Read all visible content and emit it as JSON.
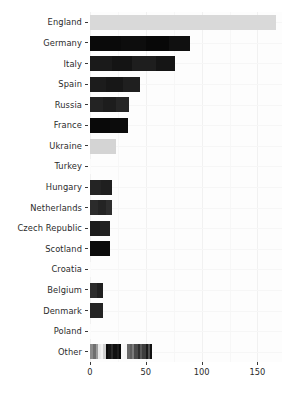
{
  "chart_data": {
    "type": "bar",
    "orientation": "horizontal",
    "title": "",
    "subtitle": "",
    "xlabel": "",
    "ylabel": "",
    "xlim": [
      0,
      172
    ],
    "xticks": [
      0,
      50,
      100,
      150
    ],
    "xticklabels": [
      "0",
      "50",
      "100",
      "150"
    ],
    "grid": true,
    "legend": "none",
    "categories": [
      "England",
      "Germany",
      "Italy",
      "Spain",
      "Russia",
      "France",
      "Ukraine",
      "Turkey",
      "Hungary",
      "Netherlands",
      "Czech Republic",
      "Scotland",
      "Croatia",
      "Belgium",
      "Denmark",
      "Poland",
      "Other"
    ],
    "values": [
      167,
      90,
      76,
      45,
      35,
      34,
      23,
      1,
      20,
      20,
      18,
      18,
      1,
      12,
      12,
      1,
      56
    ],
    "bars": [
      {
        "category": "England",
        "total": 167,
        "segments": [
          {
            "value": 167,
            "color": "#d9d9d9"
          }
        ]
      },
      {
        "category": "Germany",
        "total": 90,
        "segments": [
          {
            "value": 28,
            "color": "#0a0a0a"
          },
          {
            "value": 22,
            "color": "#0d0d0d"
          },
          {
            "value": 21,
            "color": "#080808"
          },
          {
            "value": 19,
            "color": "#101010"
          }
        ]
      },
      {
        "category": "Italy",
        "total": 76,
        "segments": [
          {
            "value": 20,
            "color": "#1a1a1a"
          },
          {
            "value": 18,
            "color": "#141414"
          },
          {
            "value": 21,
            "color": "#1e1e1e"
          },
          {
            "value": 17,
            "color": "#151515"
          }
        ]
      },
      {
        "category": "Spain",
        "total": 45,
        "segments": [
          {
            "value": 14,
            "color": "#1c1c1c"
          },
          {
            "value": 16,
            "color": "#171717"
          },
          {
            "value": 15,
            "color": "#1f1f1f"
          }
        ]
      },
      {
        "category": "Russia",
        "total": 35,
        "segments": [
          {
            "value": 12,
            "color": "#232323"
          },
          {
            "value": 11,
            "color": "#1d1d1d"
          },
          {
            "value": 12,
            "color": "#262626"
          }
        ]
      },
      {
        "category": "France",
        "total": 34,
        "segments": [
          {
            "value": 18,
            "color": "#090909"
          },
          {
            "value": 16,
            "color": "#0c0c0c"
          }
        ]
      },
      {
        "category": "Ukraine",
        "total": 23,
        "segments": [
          {
            "value": 23,
            "color": "#d4d4d4"
          }
        ]
      },
      {
        "category": "Turkey",
        "total": 1,
        "segments": [
          {
            "value": 1,
            "color": "#fbfbfb"
          }
        ]
      },
      {
        "category": "Hungary",
        "total": 20,
        "segments": [
          {
            "value": 10,
            "color": "#242424"
          },
          {
            "value": 10,
            "color": "#1f1f1f"
          }
        ]
      },
      {
        "category": "Netherlands",
        "total": 20,
        "segments": [
          {
            "value": 7,
            "color": "#2b2b2b"
          },
          {
            "value": 7,
            "color": "#242424"
          },
          {
            "value": 6,
            "color": "#2e2e2e"
          }
        ]
      },
      {
        "category": "Czech Republic",
        "total": 18,
        "segments": [
          {
            "value": 9,
            "color": "#1b1b1b"
          },
          {
            "value": 9,
            "color": "#212121"
          }
        ]
      },
      {
        "category": "Scotland",
        "total": 18,
        "segments": [
          {
            "value": 18,
            "color": "#0b0b0b"
          }
        ]
      },
      {
        "category": "Croatia",
        "total": 1,
        "segments": [
          {
            "value": 1,
            "color": "#fbfbfb"
          }
        ]
      },
      {
        "category": "Belgium",
        "total": 12,
        "segments": [
          {
            "value": 6,
            "color": "#2c2c2c"
          },
          {
            "value": 6,
            "color": "#202020"
          }
        ]
      },
      {
        "category": "Denmark",
        "total": 12,
        "segments": [
          {
            "value": 12,
            "color": "#242424"
          }
        ]
      },
      {
        "category": "Poland",
        "total": 1,
        "segments": [
          {
            "value": 1,
            "color": "#fbfbfb"
          }
        ]
      },
      {
        "category": "Other",
        "total": 56,
        "segments": [
          {
            "value": 3,
            "color": "#8a8a8a"
          },
          {
            "value": 2,
            "color": "#6f6f6f"
          },
          {
            "value": 2,
            "color": "#9c9c9c"
          },
          {
            "value": 3,
            "color": "#e8e8e8"
          },
          {
            "value": 2,
            "color": "#f2f2f2"
          },
          {
            "value": 2,
            "color": "#cfcfcf"
          },
          {
            "value": 2,
            "color": "#0a0a0a"
          },
          {
            "value": 3,
            "color": "#151515"
          },
          {
            "value": 2,
            "color": "#2a2a2a"
          },
          {
            "value": 3,
            "color": "#101010"
          },
          {
            "value": 2,
            "color": "#1d1d1d"
          },
          {
            "value": 2,
            "color": "#080808"
          },
          {
            "value": 3,
            "color": "#fafafa"
          },
          {
            "value": 2,
            "color": "#f6f6f6"
          },
          {
            "value": 3,
            "color": "#6a6a6a"
          },
          {
            "value": 2,
            "color": "#5e5e5e"
          },
          {
            "value": 2,
            "color": "#7b7b7b"
          },
          {
            "value": 3,
            "color": "#4a4a4a"
          },
          {
            "value": 2,
            "color": "#2f2f2f"
          },
          {
            "value": 2,
            "color": "#585858"
          },
          {
            "value": 3,
            "color": "#3d3d3d"
          },
          {
            "value": 2,
            "color": "#1a1a1a"
          },
          {
            "value": 2,
            "color": "#4f4f4f"
          },
          {
            "value": 2,
            "color": "#121212"
          }
        ]
      }
    ]
  },
  "style": {
    "panel_background": "#fdfdfd",
    "grid_color": "#f1f1f1",
    "axis_text_color": "#2b2b2b",
    "page_background": "#ffffff"
  }
}
